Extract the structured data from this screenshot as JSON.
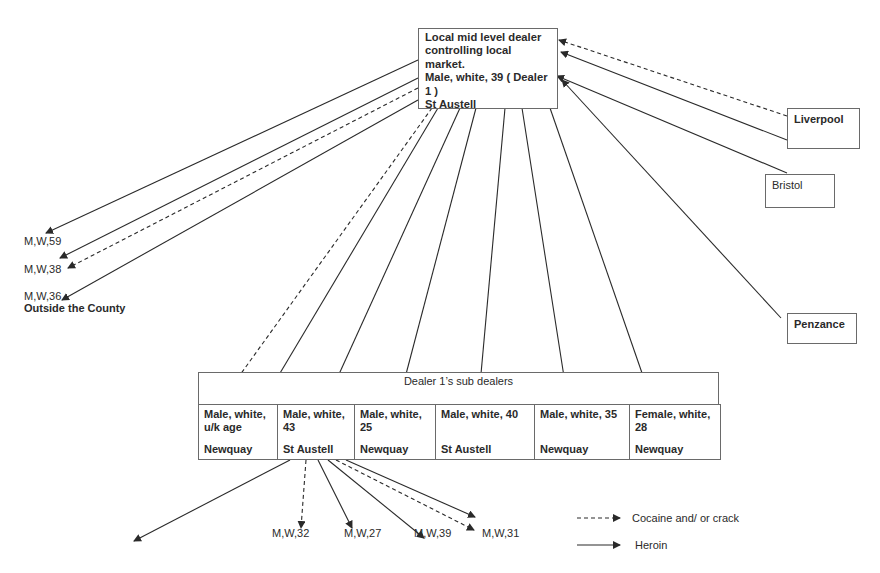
{
  "main_dealer": {
    "lines": [
      "Local mid level dealer",
      "controlling  local",
      "market.",
      "Male, white, 39 ( Dealer",
      "1 )",
      "St Austell"
    ]
  },
  "sources": [
    {
      "name": "Liverpool",
      "bold": true
    },
    {
      "name": "Bristol",
      "bold": false
    },
    {
      "name": "Penzance",
      "bold": true
    }
  ],
  "outside_county": {
    "buyers": [
      "M,W,59",
      "M,W,38",
      "M,W,36"
    ],
    "label": "Outside the County"
  },
  "sub_dealers": {
    "header": "Dealer 1’s sub dealers",
    "cells": [
      {
        "desc": "Male, white, u/k age",
        "location": "Newquay"
      },
      {
        "desc": "Male, white, 43",
        "location": "St Austell"
      },
      {
        "desc": "Male, white, 25",
        "location": "Newquay"
      },
      {
        "desc": "Male, white, 40",
        "location": "St Austell"
      },
      {
        "desc": "Male, white, 35",
        "location": "Newquay"
      },
      {
        "desc": "Female, white, 28",
        "location": "Newquay"
      }
    ]
  },
  "st_austell_buyers": [
    "M,W,32",
    "M,W,27",
    "M,W,39",
    "M,W,31"
  ],
  "legend": {
    "dashed": "Cocaine and/ or crack",
    "solid": "Heroin"
  },
  "colors": {
    "line": "#2a2a2a",
    "border": "#6a6a6a"
  }
}
